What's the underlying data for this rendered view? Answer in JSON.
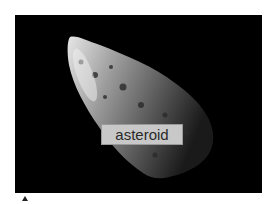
{
  "image": {
    "subject": "asteroid",
    "background_color": "#000000"
  },
  "label": {
    "text": "asteroid",
    "background_color": "#c8c8c8",
    "text_color": "#2a2a2a"
  }
}
